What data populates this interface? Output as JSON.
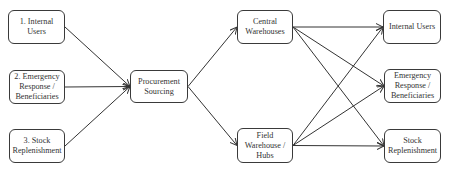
{
  "diagram": {
    "type": "flow",
    "nodes": [
      {
        "id": "internal-src",
        "label": "1. Internal\nUsers"
      },
      {
        "id": "emerg-src",
        "label": "2. Emergency\nResponse /\nBeneficiaries"
      },
      {
        "id": "stock-src",
        "label": "3. Stock\nReplenishment"
      },
      {
        "id": "procure",
        "label": "Procurement\nSourcing"
      },
      {
        "id": "central",
        "label": "Central\nWarehouses"
      },
      {
        "id": "field",
        "label": "Field\nWarehouse /\nHubs"
      },
      {
        "id": "internal-dst",
        "label": "Internal Users"
      },
      {
        "id": "emerg-dst",
        "label": "Emergency\nResponse /\nBeneficiaries"
      },
      {
        "id": "stock-dst",
        "label": "Stock\nReplenishment"
      }
    ],
    "edges": [
      {
        "from": "internal-src",
        "to": "procure"
      },
      {
        "from": "emerg-src",
        "to": "procure"
      },
      {
        "from": "stock-src",
        "to": "procure"
      },
      {
        "from": "procure",
        "to": "central"
      },
      {
        "from": "procure",
        "to": "field"
      },
      {
        "from": "central",
        "to": "internal-dst"
      },
      {
        "from": "central",
        "to": "emerg-dst"
      },
      {
        "from": "central",
        "to": "stock-dst"
      },
      {
        "from": "field",
        "to": "internal-dst"
      },
      {
        "from": "field",
        "to": "emerg-dst"
      },
      {
        "from": "field",
        "to": "stock-dst"
      }
    ]
  }
}
